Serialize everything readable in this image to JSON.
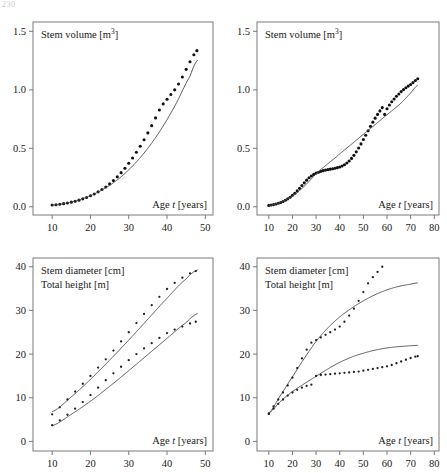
{
  "page": {
    "corner_mark": "230"
  },
  "chart_data": [
    {
      "id": "top-left",
      "type": "scatter",
      "title": "Stem volume [m3]",
      "title_base": "Stem volume [m",
      "title_sup": "3",
      "title_tail": "]",
      "xlabel_pre": "Age ",
      "xlabel_var": "t",
      "xlabel_post": " [years]",
      "ylabel": "",
      "xlim": [
        5,
        52
      ],
      "ylim": [
        -0.07,
        1.58
      ],
      "xticks": [
        10,
        20,
        30,
        40,
        50
      ],
      "yticks": [
        "0.0",
        "0.5",
        "1.0",
        "1.5"
      ],
      "ytick_values": [
        0.0,
        0.5,
        1.0,
        1.5
      ],
      "grid": false,
      "legend": "none",
      "series": [
        {
          "name": "measured stem volume",
          "style": "dots",
          "x": [
            10,
            11,
            12,
            13,
            14,
            15,
            16,
            17,
            18,
            19,
            20,
            21,
            22,
            23,
            24,
            25,
            26,
            27,
            28,
            29,
            30,
            31,
            32,
            33,
            34,
            35,
            36,
            37,
            38,
            39,
            40,
            41,
            42,
            43,
            44,
            45,
            46,
            47,
            47.8
          ],
          "y": [
            0.015,
            0.018,
            0.022,
            0.027,
            0.033,
            0.04,
            0.048,
            0.057,
            0.068,
            0.08,
            0.094,
            0.11,
            0.128,
            0.148,
            0.17,
            0.196,
            0.224,
            0.256,
            0.292,
            0.33,
            0.372,
            0.417,
            0.466,
            0.518,
            0.573,
            0.632,
            0.694,
            0.76,
            0.828,
            0.88,
            0.92,
            0.96,
            1.0,
            1.05,
            1.11,
            1.175,
            1.24,
            1.3,
            1.335
          ]
        },
        {
          "name": "fitted growth curve",
          "style": "line",
          "x": [
            10,
            14,
            18,
            22,
            26,
            30,
            34,
            38,
            42,
            46,
            48
          ],
          "y": [
            0.014,
            0.034,
            0.07,
            0.126,
            0.206,
            0.316,
            0.46,
            0.64,
            0.86,
            1.115,
            1.255
          ]
        }
      ]
    },
    {
      "id": "top-right",
      "type": "scatter",
      "title": "Stem volume [m3]",
      "title_base": "Stem volume [m",
      "title_sup": "3",
      "title_tail": "]",
      "xlabel_pre": "Age ",
      "xlabel_var": "t",
      "xlabel_post": " [years]",
      "ylabel": "",
      "xlim": [
        5,
        82
      ],
      "ylim": [
        -0.07,
        1.58
      ],
      "xticks": [
        10,
        20,
        30,
        40,
        50,
        60,
        70,
        80
      ],
      "yticks": [
        "0.0",
        "0.5",
        "1.0",
        "1.5"
      ],
      "ytick_values": [
        0.0,
        0.5,
        1.0,
        1.5
      ],
      "grid": false,
      "legend": "none",
      "series": [
        {
          "name": "measured stem volume",
          "style": "dots",
          "x": [
            10,
            11,
            12,
            13,
            14,
            15,
            16,
            17,
            18,
            19,
            20,
            21,
            22,
            23,
            24,
            25,
            26,
            27,
            28,
            29,
            30,
            31,
            32,
            33,
            34,
            35,
            36,
            37,
            38,
            39,
            40,
            41,
            42,
            43,
            44,
            45,
            46,
            47,
            48,
            49,
            50,
            51,
            52,
            53,
            54,
            55,
            56,
            57,
            58,
            59,
            60,
            61,
            62,
            63,
            64,
            65,
            66,
            67,
            68,
            69,
            70,
            71,
            72,
            73
          ],
          "y": [
            0.012,
            0.015,
            0.019,
            0.024,
            0.03,
            0.037,
            0.046,
            0.056,
            0.068,
            0.082,
            0.098,
            0.116,
            0.136,
            0.158,
            0.182,
            0.205,
            0.228,
            0.248,
            0.264,
            0.277,
            0.288,
            0.296,
            0.303,
            0.309,
            0.314,
            0.318,
            0.322,
            0.326,
            0.33,
            0.335,
            0.341,
            0.349,
            0.36,
            0.374,
            0.392,
            0.414,
            0.44,
            0.47,
            0.503,
            0.538,
            0.575,
            0.612,
            0.65,
            0.688,
            0.724,
            0.758,
            0.79,
            0.82,
            0.848,
            0.79,
            0.838,
            0.87,
            0.898,
            0.922,
            0.945,
            0.965,
            0.985,
            1.002,
            1.018,
            1.032,
            1.046,
            1.062,
            1.08,
            1.095
          ]
        },
        {
          "name": "fitted growth curve",
          "style": "line",
          "x": [
            10,
            14,
            18,
            22,
            26,
            30,
            34,
            38,
            42,
            46,
            50,
            54,
            58,
            62,
            66,
            70,
            73
          ],
          "y": [
            0.012,
            0.032,
            0.068,
            0.122,
            0.196,
            0.282,
            0.352,
            0.418,
            0.486,
            0.552,
            0.62,
            0.686,
            0.754,
            0.82,
            0.888,
            0.972,
            1.04
          ]
        }
      ]
    },
    {
      "id": "bottom-left",
      "type": "line",
      "title_line1": "Stem diameter [cm]",
      "title_line2": "Total height [m]",
      "xlabel_pre": "Age ",
      "xlabel_var": "t",
      "xlabel_post": " [years]",
      "ylabel": "",
      "xlim": [
        5,
        52
      ],
      "ylim": [
        -2.2,
        42
      ],
      "xticks": [
        10,
        20,
        30,
        40,
        50
      ],
      "yticks": [
        "0",
        "10",
        "20",
        "30",
        "40"
      ],
      "ytick_values": [
        0,
        10,
        20,
        30,
        40
      ],
      "grid": false,
      "legend": "none",
      "series": [
        {
          "name": "stem diameter model",
          "style": "line",
          "x": [
            10,
            15,
            20,
            25,
            30,
            35,
            40,
            45,
            48
          ],
          "y": [
            6.8,
            10.2,
            14.2,
            18.6,
            23.2,
            28.0,
            32.8,
            37.2,
            39.3
          ]
        },
        {
          "name": "stem diameter measured",
          "style": "dots",
          "x": [
            10,
            12,
            14,
            16,
            18,
            20,
            22,
            24,
            26,
            28,
            30,
            32,
            34,
            36,
            38,
            40,
            42,
            44,
            46,
            47.5
          ],
          "y": [
            6.2,
            7.8,
            9.6,
            11.4,
            13.2,
            15.0,
            16.9,
            18.8,
            20.8,
            22.9,
            25.0,
            27.1,
            29.2,
            31.2,
            33.1,
            34.9,
            36.3,
            37.5,
            38.5,
            39.0
          ]
        },
        {
          "name": "total height model",
          "style": "line",
          "x": [
            10,
            15,
            20,
            25,
            30,
            35,
            40,
            45,
            48
          ],
          "y": [
            3.6,
            6.2,
            9.2,
            12.6,
            16.2,
            19.9,
            23.6,
            27.2,
            29.3
          ]
        },
        {
          "name": "total height measured",
          "style": "dots",
          "x": [
            10,
            12,
            14,
            16,
            18,
            20,
            22,
            24,
            26,
            28,
            30,
            32,
            34,
            36,
            38,
            40,
            42,
            44,
            46,
            47.5
          ],
          "y": [
            3.7,
            4.8,
            6.1,
            7.5,
            9.0,
            10.6,
            12.3,
            14.0,
            15.6,
            17.1,
            18.6,
            20.0,
            21.3,
            22.5,
            23.7,
            24.8,
            25.6,
            26.3,
            27.0,
            27.4
          ]
        }
      ]
    },
    {
      "id": "bottom-right",
      "type": "line",
      "title_line1": "Stem diameter [cm]",
      "title_line2": "Total height [m]",
      "xlabel_pre": "Age ",
      "xlabel_var": "t",
      "xlabel_post": " [years]",
      "ylabel": "",
      "xlim": [
        5,
        82
      ],
      "ylim": [
        -2.2,
        42
      ],
      "xticks": [
        10,
        20,
        30,
        40,
        50,
        60,
        70,
        80
      ],
      "yticks": [
        "0",
        "10",
        "20",
        "30",
        "40"
      ],
      "ytick_values": [
        0,
        10,
        20,
        30,
        40
      ],
      "grid": false,
      "legend": "none",
      "series": [
        {
          "name": "stem diameter model",
          "style": "line",
          "x": [
            10,
            15,
            20,
            25,
            30,
            35,
            40,
            45,
            50,
            55,
            60,
            65,
            70,
            73
          ],
          "y": [
            6.5,
            10.6,
            14.8,
            19.0,
            22.9,
            26.0,
            28.5,
            30.5,
            32.2,
            33.6,
            34.7,
            35.5,
            36.0,
            36.3
          ]
        },
        {
          "name": "stem diameter measured",
          "style": "dots",
          "x": [
            10,
            12,
            14,
            16,
            18,
            20,
            22,
            24,
            26,
            28,
            30,
            32,
            34,
            36,
            38,
            40,
            42,
            44,
            46,
            48,
            50,
            52,
            54,
            56,
            58
          ],
          "y": [
            6.4,
            8.0,
            9.6,
            11.2,
            12.8,
            14.6,
            16.8,
            19.0,
            21.0,
            22.6,
            23.2,
            23.8,
            24.4,
            25.0,
            25.6,
            26.3,
            27.4,
            28.8,
            30.4,
            32.2,
            34.2,
            36.2,
            37.6,
            38.8,
            40.0
          ]
        },
        {
          "name": "total height model",
          "style": "line",
          "x": [
            10,
            15,
            20,
            25,
            30,
            35,
            40,
            45,
            50,
            55,
            60,
            65,
            70,
            73
          ],
          "y": [
            6.5,
            9.2,
            11.4,
            13.2,
            14.9,
            16.6,
            18.1,
            19.3,
            20.2,
            20.9,
            21.4,
            21.7,
            21.9,
            22.0
          ]
        },
        {
          "name": "total height measured",
          "style": "dots",
          "x": [
            10,
            12,
            14,
            16,
            18,
            20,
            22,
            24,
            26,
            28,
            30,
            32,
            34,
            36,
            38,
            40,
            42,
            44,
            46,
            48,
            50,
            52,
            54,
            56,
            58,
            60,
            62,
            64,
            66,
            68,
            70,
            72,
            73
          ],
          "y": [
            6.3,
            7.5,
            8.6,
            9.6,
            10.5,
            11.2,
            11.8,
            12.3,
            12.7,
            13.0,
            15.0,
            15.2,
            15.3,
            15.4,
            15.5,
            15.6,
            15.7,
            15.8,
            15.9,
            16.0,
            16.2,
            16.4,
            16.6,
            16.8,
            17.0,
            17.2,
            17.5,
            17.9,
            18.3,
            18.7,
            19.1,
            19.4,
            19.5
          ]
        }
      ]
    }
  ]
}
